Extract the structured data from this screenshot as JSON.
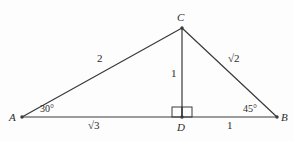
{
  "figure": {
    "type": "geometry-diagram",
    "background_color": "#fdfdfd",
    "stroke_color": "#3a3a3a",
    "text_color": "#2b2b2b",
    "vertices": [
      {
        "name": "A",
        "label": "A",
        "x": 22,
        "y": 117,
        "label_x": 9,
        "label_y": 112
      },
      {
        "name": "B",
        "label": "B",
        "x": 277,
        "y": 117,
        "label_x": 281,
        "label_y": 112
      },
      {
        "name": "C",
        "label": "C",
        "x": 182,
        "y": 28,
        "label_x": 177,
        "label_y": 12
      },
      {
        "name": "D",
        "label": "D",
        "x": 182,
        "y": 117,
        "label_x": 177,
        "label_y": 122
      }
    ],
    "segments": [
      {
        "name": "segment-AB",
        "from": "A",
        "to": "B",
        "x1": 22,
        "y1": 117,
        "x2": 277,
        "y2": 117
      },
      {
        "name": "segment-AC",
        "from": "A",
        "to": "C",
        "x1": 22,
        "y1": 117,
        "x2": 182,
        "y2": 28
      },
      {
        "name": "segment-CB",
        "from": "C",
        "to": "B",
        "x1": 182,
        "y1": 28,
        "x2": 277,
        "y2": 117
      },
      {
        "name": "segment-CD",
        "from": "C",
        "to": "D",
        "x1": 182,
        "y1": 28,
        "x2": 182,
        "y2": 117
      }
    ],
    "side_labels": [
      {
        "name": "label-AC",
        "text": "2",
        "x": 97,
        "y": 53
      },
      {
        "name": "label-CB",
        "text": "√2",
        "x": 228,
        "y": 53
      },
      {
        "name": "label-CD",
        "text": "1",
        "x": 171,
        "y": 68
      },
      {
        "name": "label-AD",
        "text": "√3",
        "x": 88,
        "y": 120
      },
      {
        "name": "label-DB",
        "text": "1",
        "x": 227,
        "y": 120
      }
    ],
    "angle_labels": [
      {
        "name": "angle-A",
        "text": "30°",
        "x": 40,
        "y": 104,
        "vertex": "A"
      },
      {
        "name": "angle-B",
        "text": "45°",
        "x": 243,
        "y": 104,
        "vertex": "B"
      }
    ],
    "right_angle_marks": [
      {
        "name": "right-angle-mark-left",
        "x": 172,
        "y": 107,
        "size": 10
      },
      {
        "name": "right-angle-mark-right",
        "x": 182,
        "y": 107,
        "size": 10
      }
    ]
  }
}
